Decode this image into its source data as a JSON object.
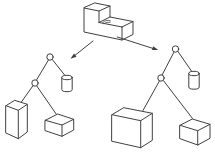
{
  "figure": {
    "background": "#ffffff",
    "line_color": "#404040",
    "source_solid": {
      "shape": "l-shaped-block",
      "detail": "seam marks on step top face"
    },
    "arrows": [
      {
        "name": "arrow-to-left-tree",
        "direction": "down-left"
      },
      {
        "name": "arrow-to-right-tree",
        "direction": "down-right"
      }
    ],
    "trees": [
      {
        "name": "left-tree",
        "root": {
          "type": "operator-node",
          "left": {
            "type": "operator-node",
            "left": {
              "type": "leaf",
              "shape": "tall-box"
            },
            "right": {
              "type": "leaf",
              "shape": "small-box"
            }
          },
          "right": {
            "type": "leaf",
            "shape": "cylinder"
          }
        }
      },
      {
        "name": "right-tree",
        "root": {
          "type": "operator-node",
          "left": {
            "type": "operator-node",
            "left": {
              "type": "leaf",
              "shape": "large-box"
            },
            "right": {
              "type": "leaf",
              "shape": "small-box"
            }
          },
          "right": {
            "type": "leaf",
            "shape": "cylinder"
          }
        }
      }
    ]
  }
}
